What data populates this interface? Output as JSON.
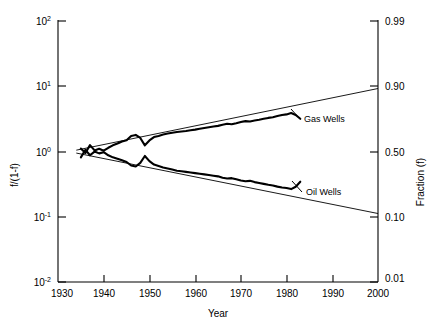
{
  "chart_data": {
    "type": "line",
    "title": "",
    "xlabel": "Year",
    "ylabel": "f/(1-f)",
    "ylabel_right": "Fraction (f)",
    "xlim": [
      1930,
      2000
    ],
    "ylim": [
      0.01,
      100
    ],
    "yscale": "log",
    "grid": false,
    "legend_position": "inline-annotations",
    "xticks": [
      1930,
      1940,
      1950,
      1960,
      1970,
      1980,
      1990,
      2000
    ],
    "xtick_labels": [
      "1930",
      "1940",
      "1950",
      "1960",
      "1970",
      "1980",
      "1990",
      "2000"
    ],
    "yticks": [
      0.01,
      0.1,
      1,
      10,
      100
    ],
    "ytick_labels": [
      "10-2",
      "10-1",
      "100",
      "101",
      "102"
    ],
    "ytick_mantissa": [
      "10",
      "10",
      "10",
      "10",
      "10"
    ],
    "ytick_exponent": [
      "-2",
      "-1",
      "0",
      "1",
      "2"
    ],
    "right_yticks": [
      0.01,
      0.1,
      0.5,
      0.9,
      0.99
    ],
    "right_ytick_labels": [
      "0.01",
      "0.10",
      "0.50",
      "0.90",
      "0.99"
    ],
    "annotations": [
      {
        "text": "Gas Wells",
        "x": 1986,
        "y": 2.9
      },
      {
        "text": "Oil Wells",
        "x": 1986,
        "y": 0.26
      }
    ],
    "series": [
      {
        "name": "Gas Wells",
        "kind": "data",
        "x": [
          1935,
          1936,
          1937,
          1938,
          1939,
          1940,
          1941,
          1942,
          1943,
          1944,
          1945,
          1946,
          1947,
          1948,
          1949,
          1950,
          1951,
          1952,
          1953,
          1954,
          1955,
          1956,
          1957,
          1958,
          1959,
          1960,
          1961,
          1962,
          1963,
          1964,
          1965,
          1966,
          1967,
          1968,
          1969,
          1970,
          1971,
          1972,
          1973,
          1974,
          1975,
          1976,
          1977,
          1978,
          1979,
          1980,
          1981,
          1982,
          1983
        ],
        "y": [
          1.09,
          0.93,
          1.23,
          1.02,
          1.08,
          1.01,
          1.12,
          1.22,
          1.3,
          1.4,
          1.46,
          1.7,
          1.76,
          1.58,
          1.22,
          1.45,
          1.63,
          1.7,
          1.78,
          1.85,
          1.9,
          1.95,
          1.99,
          2.02,
          2.08,
          2.12,
          2.18,
          2.24,
          2.3,
          2.36,
          2.42,
          2.52,
          2.6,
          2.56,
          2.66,
          2.78,
          2.86,
          2.82,
          2.92,
          3.0,
          3.1,
          3.2,
          3.28,
          3.42,
          3.54,
          3.62,
          3.8,
          3.55,
          3.1
        ]
      },
      {
        "name": "Gas Wells Trend",
        "kind": "trend",
        "x": [
          1934,
          2000
        ],
        "y": [
          1.03,
          9.0
        ]
      },
      {
        "name": "Oil Wells",
        "kind": "data",
        "x": [
          1935,
          1936,
          1937,
          1938,
          1939,
          1940,
          1941,
          1942,
          1943,
          1944,
          1945,
          1946,
          1947,
          1948,
          1949,
          1950,
          1951,
          1952,
          1953,
          1954,
          1955,
          1956,
          1957,
          1958,
          1959,
          1960,
          1961,
          1962,
          1963,
          1964,
          1965,
          1966,
          1967,
          1968,
          1969,
          1970,
          1971,
          1972,
          1973,
          1974,
          1975,
          1976,
          1977,
          1978,
          1979,
          1980,
          1981,
          1982,
          1983
        ],
        "y": [
          0.8,
          1.04,
          0.86,
          0.98,
          0.92,
          0.96,
          0.86,
          0.8,
          0.76,
          0.72,
          0.68,
          0.6,
          0.58,
          0.66,
          0.84,
          0.7,
          0.62,
          0.59,
          0.56,
          0.54,
          0.52,
          0.5,
          0.49,
          0.48,
          0.47,
          0.46,
          0.45,
          0.44,
          0.43,
          0.42,
          0.41,
          0.39,
          0.38,
          0.385,
          0.37,
          0.355,
          0.345,
          0.35,
          0.335,
          0.325,
          0.315,
          0.305,
          0.298,
          0.286,
          0.277,
          0.272,
          0.262,
          0.285,
          0.34
        ]
      },
      {
        "name": "Oil Wells Trend",
        "kind": "trend",
        "x": [
          1934,
          2000
        ],
        "y": [
          0.93,
          0.111
        ]
      }
    ]
  }
}
